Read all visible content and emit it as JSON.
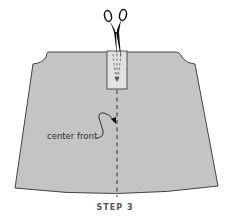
{
  "diagram": {
    "callout_label": "center front",
    "step_label": "STEP 3",
    "colors": {
      "fabric": "#c4c4c4",
      "placket": "#e2e2e2",
      "outline": "#333333",
      "scissors": "#111111"
    }
  }
}
